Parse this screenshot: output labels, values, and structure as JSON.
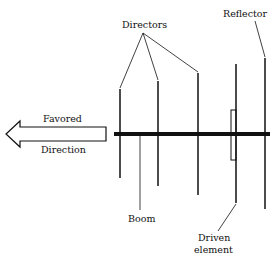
{
  "diagram": {
    "labels": {
      "directors": "Directors",
      "reflector": "Reflector",
      "boom": "Boom",
      "driven_line1": "Driven",
      "driven_line2": "element",
      "favored": "Favored",
      "direction": "Direction"
    },
    "colors": {
      "line": "#111111",
      "background": "#ffffff"
    },
    "boom": {
      "x1": 114,
      "x2": 270,
      "y": 134,
      "thickness": 4
    },
    "elements": [
      {
        "name": "director-1",
        "x": 120,
        "y1": 89,
        "y2": 178
      },
      {
        "name": "director-2",
        "x": 158,
        "y1": 81,
        "y2": 186
      },
      {
        "name": "director-3",
        "x": 198,
        "y1": 73,
        "y2": 195
      },
      {
        "name": "driven-element",
        "x": 236,
        "y1": 64,
        "y2": 203
      },
      {
        "name": "reflector",
        "x": 265,
        "y1": 58,
        "y2": 209
      }
    ]
  }
}
